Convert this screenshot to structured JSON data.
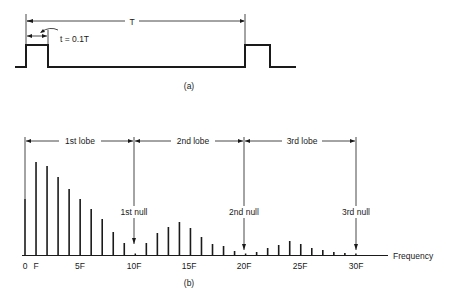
{
  "figure_a": {
    "period_label": "T",
    "pulse_width_label": "t = 0.1T",
    "caption": "(a)"
  },
  "figure_b": {
    "lobes": [
      {
        "label": "1st lobe"
      },
      {
        "label": "2nd lobe"
      },
      {
        "label": "3rd lobe"
      }
    ],
    "nulls": [
      {
        "label": "1st null"
      },
      {
        "label": "2nd null"
      },
      {
        "label": "3rd null"
      }
    ],
    "x_axis_label": "Frequency",
    "tick_labels": [
      "0",
      "F",
      "5F",
      "10F",
      "15F",
      "20F",
      "25F",
      "30F"
    ],
    "caption": "(b)"
  },
  "chart_data": {
    "type": "bar",
    "xlabel": "Frequency",
    "ylabel": "",
    "categories": [
      "0",
      "F",
      "2F",
      "3F",
      "4F",
      "5F",
      "6F",
      "7F",
      "8F",
      "9F",
      "10F",
      "11F",
      "12F",
      "13F",
      "14F",
      "15F",
      "16F",
      "17F",
      "18F",
      "19F",
      "20F",
      "21F",
      "22F",
      "23F",
      "24F",
      "25F",
      "26F",
      "27F",
      "28F",
      "29F",
      "30F"
    ],
    "values": [
      56,
      93,
      89,
      78,
      66,
      56,
      46,
      36,
      23,
      12,
      0,
      12,
      22,
      28,
      33,
      27,
      18,
      11,
      9,
      4,
      0,
      3,
      7,
      10,
      14,
      11,
      7,
      5,
      3,
      2,
      0
    ],
    "annotations": [
      "1st lobe",
      "2nd lobe",
      "3rd lobe",
      "1st null",
      "2nd null",
      "3rd null"
    ],
    "grid": false
  }
}
